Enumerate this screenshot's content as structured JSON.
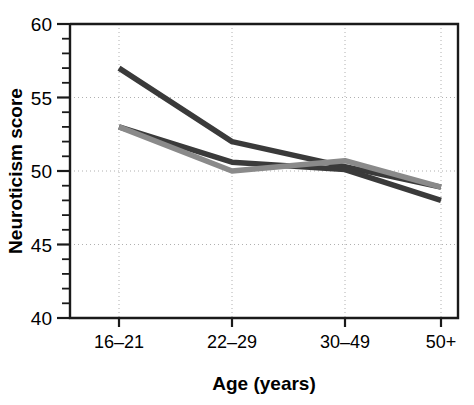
{
  "chart_data": {
    "type": "line",
    "title": "",
    "xlabel": "Age (years)",
    "ylabel": "Neuroticism score",
    "categories": [
      "16–21",
      "22–29",
      "30–49",
      "50+"
    ],
    "ylim": [
      40,
      60
    ],
    "ytick_labels": [
      "40",
      "45",
      "50",
      "55",
      "60"
    ],
    "ytick_values": [
      40,
      45,
      50,
      55,
      60
    ],
    "yminor_step": 1,
    "grid": "dotted-both",
    "grid_color": "#b0b0b0",
    "legend": "none",
    "axis_color": "#1a1a1a",
    "series": [
      {
        "name": "series-1",
        "color": "#3a3a3a",
        "values": [
          57.0,
          52.0,
          50.3,
          48.9
        ]
      },
      {
        "name": "series-2",
        "color": "#3a3a3a",
        "values": [
          53.0,
          50.6,
          50.1,
          48.0
        ]
      },
      {
        "name": "series-3",
        "color": "#8a8a8a",
        "values": [
          53.0,
          50.0,
          50.7,
          48.9
        ]
      }
    ]
  },
  "axes": {
    "y_title": "Neuroticism score",
    "x_title": "Age (years)"
  },
  "ticks": {
    "y": [
      "60",
      "55",
      "50",
      "45",
      "40"
    ],
    "x": [
      "16–21",
      "22–29",
      "30–49",
      "50+"
    ]
  }
}
